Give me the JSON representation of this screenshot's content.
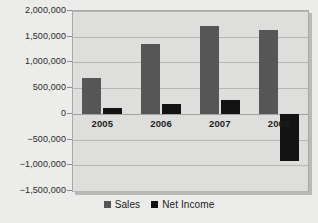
{
  "chart_data": {
    "type": "bar",
    "title": "",
    "xlabel": "",
    "ylabel": "",
    "categories": [
      "2005",
      "2006",
      "2007",
      "2008"
    ],
    "series": [
      {
        "name": "Sales",
        "color": "#565656",
        "values": [
          700000,
          1350000,
          1710000,
          1640000
        ]
      },
      {
        "name": "Net Income",
        "color": "#131313",
        "values": [
          120000,
          190000,
          270000,
          -920000
        ]
      }
    ],
    "ylim": [
      -1500000,
      2000000
    ],
    "ytick_values": [
      2000000,
      1500000,
      1000000,
      500000,
      0,
      -500000,
      -1000000,
      -1500000
    ],
    "ytick_labels": [
      "2,000,000",
      "1,500,000",
      "1,000,000",
      "500,000",
      "0",
      "-500,000",
      "-1,000,000",
      "-1,500,000"
    ],
    "grid": true,
    "legend_position": "bottom",
    "legend_entries": [
      "Sales",
      "Net Income"
    ],
    "plot_background": "#dededc",
    "page_background": "#ececeb"
  }
}
